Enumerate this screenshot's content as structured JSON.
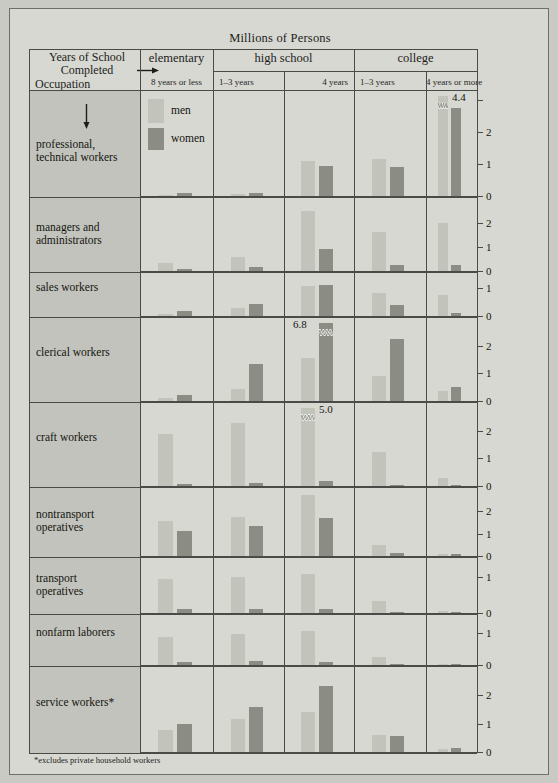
{
  "figure": {
    "supertitle": "Millions of Persons",
    "footnote": "*excludes private household workers",
    "colors": {
      "men": "#c2c3bb",
      "women": "#8b8c84",
      "rowlabel_bg": "#c2c3bd",
      "plate_bg": "#d7d8d2",
      "rule": "#4a4a46"
    }
  },
  "header": {
    "corner_line1": "Years of School",
    "corner_line2": "Completed",
    "corner_line3": "Occupation",
    "groups": [
      {
        "label": "elementary",
        "subs": [
          "8 years or less"
        ]
      },
      {
        "label": "high school",
        "subs": [
          "1–3 years",
          "4 years"
        ]
      },
      {
        "label": "college",
        "subs": [
          "1–3 years",
          "4 years or more"
        ]
      }
    ]
  },
  "legend": {
    "men": "men",
    "women": "women"
  },
  "chart_data": {
    "type": "bar",
    "title": "Millions of Persons",
    "xlabel": "Years of School Completed",
    "ylabel": "Millions of Persons",
    "categories": [
      "elementary 8 years or less",
      "high school 1–3 years",
      "high school 4 years",
      "college 1–3 years",
      "college 4 years or more"
    ],
    "series_names": [
      "men",
      "women"
    ],
    "rows": [
      {
        "occupation": "professional,\ntechnical workers",
        "label_line1": "professional,",
        "label_line2": "technical workers",
        "ymax": 3.2,
        "ticks": [
          0,
          1,
          2,
          3
        ],
        "tick_labels": [
          "0",
          "1",
          "2",
          ""
        ],
        "men": [
          0.04,
          0.07,
          1.1,
          1.15,
          4.4
        ],
        "women": [
          0.08,
          0.1,
          0.95,
          0.9,
          2.75
        ],
        "annotations": [
          {
            "series": "men",
            "category_index": 4,
            "text": "4.4",
            "broken": true
          }
        ]
      },
      {
        "occupation": "managers and administrators",
        "label_line1": "managers and",
        "label_line2": "administrators",
        "ymax": 2.9,
        "ticks": [
          0,
          1,
          2
        ],
        "tick_labels": [
          "0",
          "1",
          "2"
        ],
        "men": [
          0.35,
          0.6,
          2.5,
          1.6,
          2.0
        ],
        "women": [
          0.1,
          0.15,
          0.9,
          0.25,
          0.25
        ],
        "annotations": []
      },
      {
        "occupation": "sales workers",
        "label_line1": "sales workers",
        "label_line2": "",
        "ymax": 1.45,
        "ticks": [
          0,
          1
        ],
        "tick_labels": [
          "0",
          "1"
        ],
        "men": [
          0.07,
          0.3,
          1.1,
          0.85,
          0.75
        ],
        "women": [
          0.17,
          0.45,
          1.12,
          0.4,
          0.1
        ],
        "annotations": []
      },
      {
        "occupation": "clerical workers",
        "label_line1": "clerical workers",
        "label_line2": "",
        "ymax": 2.9,
        "ticks": [
          0,
          1,
          2
        ],
        "tick_labels": [
          "0",
          "1",
          "2"
        ],
        "men": [
          0.12,
          0.45,
          1.55,
          0.9,
          0.35
        ],
        "women": [
          0.22,
          1.35,
          6.8,
          2.25,
          0.5
        ],
        "annotations": [
          {
            "series": "women",
            "category_index": 2,
            "text": "6.8",
            "broken": true
          }
        ]
      },
      {
        "occupation": "craft workers",
        "label_line1": "craft workers",
        "label_line2": "",
        "ymax": 2.9,
        "ticks": [
          0,
          1,
          2
        ],
        "tick_labels": [
          "0",
          "1",
          "2"
        ],
        "men": [
          1.9,
          2.3,
          5.0,
          1.25,
          0.3
        ],
        "women": [
          0.08,
          0.1,
          0.18,
          0.03,
          0.02
        ],
        "annotations": [
          {
            "series": "men",
            "category_index": 2,
            "text": "5.0",
            "broken": true
          }
        ]
      },
      {
        "occupation": "nontransport operatives",
        "label_line1": "nontransport",
        "label_line2": "operatives",
        "ymax": 2.9,
        "ticks": [
          0,
          1,
          2
        ],
        "tick_labels": [
          "0",
          "1",
          "2"
        ],
        "men": [
          1.55,
          1.72,
          2.7,
          0.5,
          0.07
        ],
        "women": [
          1.1,
          1.35,
          1.7,
          0.15,
          0.08
        ],
        "annotations": []
      },
      {
        "occupation": "transport operatives",
        "label_line1": "transport",
        "label_line2": "operatives",
        "ymax": 1.45,
        "ticks": [
          0,
          1
        ],
        "tick_labels": [
          "0",
          "1"
        ],
        "men": [
          0.95,
          1.0,
          1.08,
          0.33,
          0.05
        ],
        "women": [
          0.1,
          0.12,
          0.12,
          0.02,
          0.03
        ],
        "annotations": []
      },
      {
        "occupation": "nonfarm laborers",
        "label_line1": "nonfarm laborers",
        "label_line2": "",
        "ymax": 1.45,
        "ticks": [
          0,
          1
        ],
        "tick_labels": [
          "0",
          "1"
        ],
        "men": [
          0.85,
          0.95,
          1.05,
          0.25,
          0.04
        ],
        "women": [
          0.1,
          0.12,
          0.1,
          0.01,
          0.01
        ],
        "annotations": []
      },
      {
        "occupation": "service workers*",
        "label_line1": "service workers*",
        "label_line2": "",
        "ymax": 2.9,
        "ticks": [
          0,
          1,
          2
        ],
        "tick_labels": [
          "0",
          "1",
          "2"
        ],
        "men": [
          0.78,
          1.15,
          1.4,
          0.6,
          0.12
        ],
        "women": [
          1.0,
          1.6,
          2.35,
          0.55,
          0.14
        ],
        "annotations": []
      }
    ]
  }
}
